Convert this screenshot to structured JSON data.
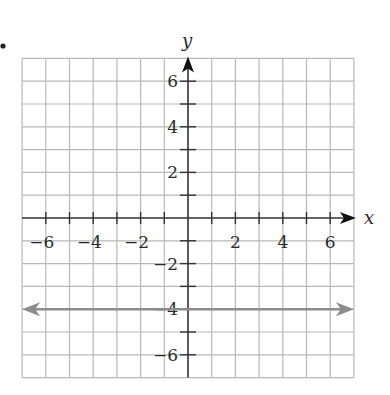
{
  "chart_data": {
    "type": "line",
    "title": "",
    "xlabel": "x",
    "ylabel": "y",
    "xlim": [
      -7,
      7
    ],
    "ylim": [
      -7,
      7
    ],
    "grid": true,
    "x_tick_labels": [
      "−6",
      "−4",
      "−2",
      "2",
      "4",
      "6"
    ],
    "x_tick_values": [
      -6,
      -4,
      -2,
      2,
      4,
      6
    ],
    "y_tick_labels": [
      "6",
      "4",
      "2",
      "−2",
      "−4",
      "−6"
    ],
    "y_tick_values": [
      6,
      4,
      2,
      -2,
      -4,
      -6
    ],
    "series": [
      {
        "name": "y = -4",
        "kind": "horizontal line with arrows on both ends",
        "x": [
          -7,
          7
        ],
        "y": [
          -4,
          -4
        ],
        "color": "#8c8c8c"
      }
    ]
  },
  "colors": {
    "grid": "#b8b8b8",
    "axis": "#333333",
    "line": "#8c8c8c"
  },
  "marker": "•"
}
